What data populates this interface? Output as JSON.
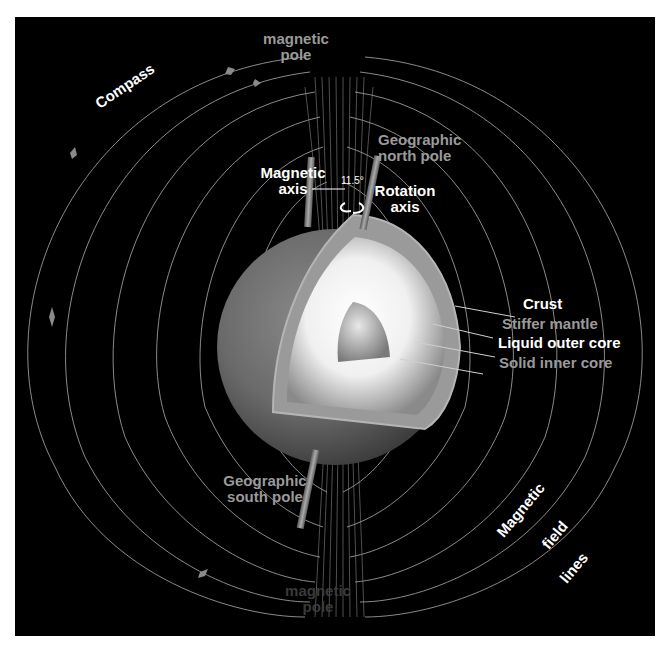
{
  "diagram": {
    "background_color": "#000000",
    "labels": {
      "top_pole": "magnetic\npole",
      "top_pole_line1": "magnetic",
      "top_pole_line2": "pole",
      "bottom_pole_line1": "magnetic",
      "bottom_pole_line2": "pole",
      "compass": "Compass",
      "geo_north_line1": "Geographic",
      "geo_north_line2": "north pole",
      "magnetic_axis_line1": "Magnetic",
      "magnetic_axis_line2": "axis",
      "angle": "11.5°",
      "rotation_axis_line1": "Rotation",
      "rotation_axis_line2": "axis",
      "geo_south_line1": "Geographic",
      "geo_south_line2": "south pole",
      "field_lines_word1": "Magnetic",
      "field_lines_word2": "field",
      "field_lines_word3": "lines"
    },
    "layers": [
      {
        "label": "Crust",
        "color": "#ffffff"
      },
      {
        "label": "Stiffer mantle",
        "color": "#9a9a9a"
      },
      {
        "label": "Liquid outer core",
        "color": "#ffffff"
      },
      {
        "label": "Solid inner core",
        "color": "#9a9a9a"
      }
    ],
    "tilt_angle_deg": 11.5
  }
}
